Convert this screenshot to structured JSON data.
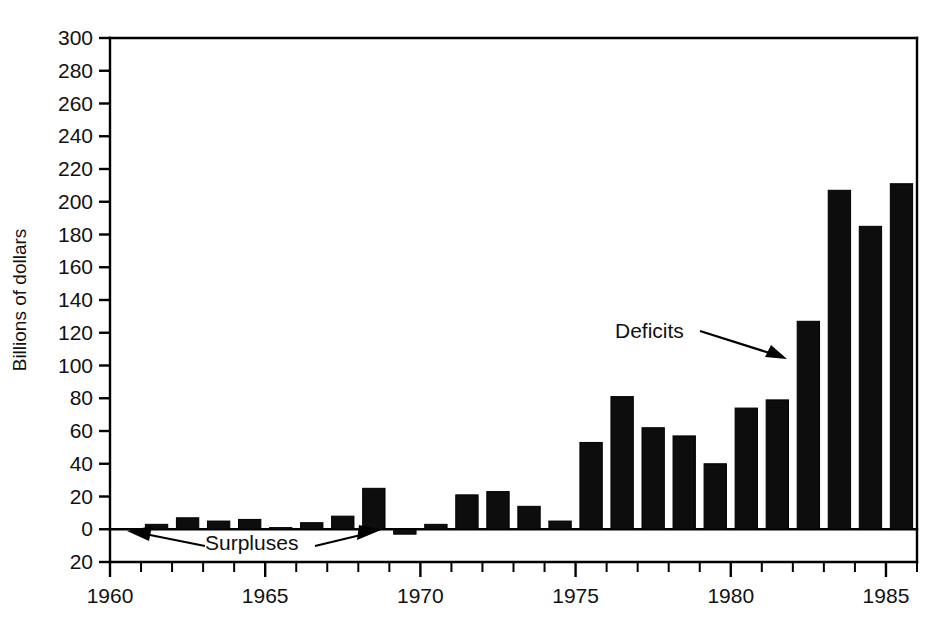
{
  "chart_data": {
    "type": "bar",
    "title": "",
    "subtitle": "",
    "xlabel": "",
    "ylabel": "Billions of dollars",
    "xlim": [
      1960,
      1986
    ],
    "ylim": [
      -20,
      300
    ],
    "grid": false,
    "legend": "none",
    "note": "Federal budget deficits (positive) and surpluses (negative) by fiscal year. Bars are drawn between year ticks.",
    "y_ticks": [
      {
        "value": 300,
        "label": "300"
      },
      {
        "value": 280,
        "label": "280"
      },
      {
        "value": 260,
        "label": "260"
      },
      {
        "value": 240,
        "label": "240"
      },
      {
        "value": 220,
        "label": "220"
      },
      {
        "value": 200,
        "label": "200"
      },
      {
        "value": 180,
        "label": "180"
      },
      {
        "value": 160,
        "label": "160"
      },
      {
        "value": 140,
        "label": "140"
      },
      {
        "value": 120,
        "label": "120"
      },
      {
        "value": 100,
        "label": "100"
      },
      {
        "value": 80,
        "label": "80"
      },
      {
        "value": 60,
        "label": "60"
      },
      {
        "value": 40,
        "label": "40"
      },
      {
        "value": 20,
        "label": "20"
      },
      {
        "value": 0,
        "label": "0"
      },
      {
        "value": -20,
        "label": "20"
      }
    ],
    "x_ticks_major": [
      {
        "value": 1960,
        "label": "1960"
      },
      {
        "value": 1965,
        "label": "1965"
      },
      {
        "value": 1970,
        "label": "1970"
      },
      {
        "value": 1975,
        "label": "1975"
      },
      {
        "value": 1980,
        "label": "1980"
      },
      {
        "value": 1985,
        "label": "1985"
      }
    ],
    "x_ticks_minor": [
      1961,
      1962,
      1963,
      1964,
      1966,
      1967,
      1968,
      1969,
      1971,
      1972,
      1973,
      1974,
      1976,
      1977,
      1978,
      1979,
      1981,
      1982,
      1983,
      1984,
      1986
    ],
    "categories": [
      1961,
      1962,
      1963,
      1964,
      1965,
      1966,
      1967,
      1968,
      1969,
      1970,
      1971,
      1972,
      1973,
      1974,
      1975,
      1976,
      1977,
      1978,
      1979,
      1980,
      1981,
      1982,
      1983,
      1984,
      1985
    ],
    "values": [
      3,
      7,
      5,
      6,
      1,
      4,
      8,
      25,
      -3,
      3,
      21,
      23,
      14,
      5,
      53,
      81,
      62,
      57,
      40,
      74,
      79,
      127,
      207,
      185,
      211
    ],
    "bar_color": "#0d0d0d"
  },
  "annotations": {
    "deficits": {
      "label": "Deficits"
    },
    "surpluses": {
      "label": "Surpluses"
    }
  }
}
